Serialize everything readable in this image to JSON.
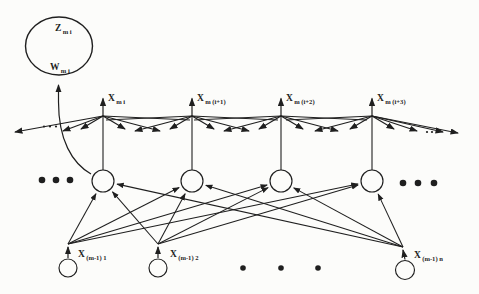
{
  "meta": {
    "width": 479,
    "height": 294,
    "ink_color": "#1f1f1f",
    "paper_color": "#fcfcfa"
  },
  "big_unit": {
    "cx": 59,
    "cy": 46,
    "rx": 33.5,
    "ry": 29,
    "stroke_w": 1.4,
    "top_label": {
      "main": "Z",
      "sub": "m i",
      "x": 55,
      "y": 31
    },
    "bottom_label": {
      "main": "W",
      "sub": "m i",
      "x": 50,
      "y": 70
    },
    "feedback_curve": {
      "path": "M 91 174 C 72 163 58.5 140 58.5 102 L 58.5 85",
      "head": true
    }
  },
  "columns": [
    {
      "x": 103,
      "hub_y": 116,
      "circle_y": 181,
      "circle_r": 11,
      "label": {
        "main": "X",
        "sub": "m i"
      },
      "fan_heads": [
        [
          81,
          129
        ],
        [
          63,
          131
        ],
        [
          15,
          132
        ],
        [
          125,
          129
        ],
        [
          160,
          131
        ]
      ],
      "fan_lines": [
        [
          190,
          120
        ]
      ]
    },
    {
      "x": 192,
      "hub_y": 116,
      "circle_y": 181,
      "circle_r": 11,
      "label": {
        "main": "X",
        "sub": "m (i+1)"
      },
      "fan_heads": [
        [
          170,
          129
        ],
        [
          135,
          131
        ],
        [
          214,
          129
        ],
        [
          249,
          131
        ]
      ],
      "fan_lines": [
        [
          106,
          120
        ],
        [
          278,
          120
        ]
      ]
    },
    {
      "x": 281,
      "hub_y": 116,
      "circle_y": 181,
      "circle_r": 11,
      "label": {
        "main": "X",
        "sub": "m (i+2)"
      },
      "fan_heads": [
        [
          259,
          129
        ],
        [
          224,
          131
        ],
        [
          303,
          129
        ],
        [
          338,
          131
        ]
      ],
      "fan_lines": [
        [
          194,
          120
        ],
        [
          367,
          120
        ]
      ]
    },
    {
      "x": 372,
      "hub_y": 116,
      "circle_y": 181,
      "circle_r": 11,
      "label": {
        "main": "X",
        "sub": "m (i+3)"
      },
      "fan_heads": [
        [
          350,
          129
        ],
        [
          315,
          131
        ],
        [
          394,
          129
        ],
        [
          417,
          131
        ],
        [
          443,
          132
        ],
        [
          458,
          133
        ]
      ],
      "fan_lines": [
        [
          286,
          120
        ]
      ]
    }
  ],
  "top_arrow": {
    "length": 17.5,
    "label_dx": 5,
    "label_baseline": 101
  },
  "feeds": [
    {
      "point": [
        68,
        244
      ],
      "circle": {
        "cx": 68,
        "cy": 268,
        "r": 9
      },
      "label": {
        "main": "X",
        "sub": "(m-1) 1",
        "x": 78,
        "y": 257
      }
    },
    {
      "point": [
        158,
        244
      ],
      "circle": {
        "cx": 158,
        "cy": 268,
        "r": 9
      },
      "label": {
        "main": "X",
        "sub": "(m-1) 2",
        "x": 170,
        "y": 257
      }
    },
    {
      "point": [
        403,
        247
      ],
      "circle": {
        "cx": 405,
        "cy": 270,
        "r": 9.5
      },
      "label": {
        "main": "X",
        "sub": "(m-1) n",
        "x": 414,
        "y": 258
      }
    }
  ],
  "ellipsis_groups": [
    {
      "name": "mid-row-left-ellipsis",
      "y": 180,
      "xs": [
        42,
        56,
        70
      ],
      "r": 3.3
    },
    {
      "name": "mid-row-right-ellipsis",
      "y": 183,
      "xs": [
        403,
        418,
        434
      ],
      "r": 3.3
    },
    {
      "name": "bottom-row-ellipsis",
      "y": 268,
      "xs": [
        243,
        281,
        318
      ],
      "r": 2.8
    },
    {
      "name": "fan-left-ellipsis",
      "y": 126.5,
      "xs": [
        44,
        50,
        56
      ],
      "r": 1.1
    },
    {
      "name": "fan-right-ellipsis",
      "y": 132,
      "xs": [
        427,
        432,
        437
      ],
      "r": 1.1
    }
  ],
  "fonts": {
    "main_size": 9.5,
    "sub_size": 6.6,
    "sub_dy": 2.6
  }
}
